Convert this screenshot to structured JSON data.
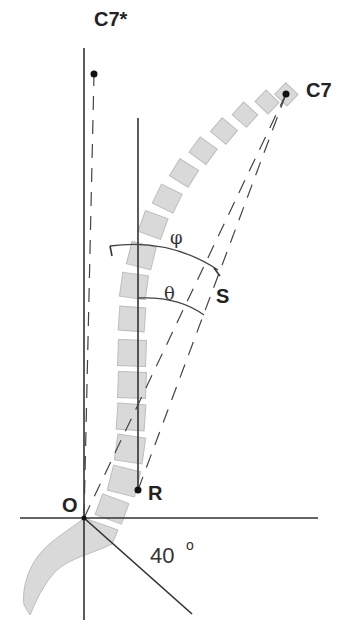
{
  "figure": {
    "labels": {
      "c7_star": "C7*",
      "c7": "C7",
      "phi": "φ",
      "theta": "θ",
      "s": "S",
      "origin": "O",
      "r": "R",
      "angle": "40",
      "degree": "o"
    },
    "colors": {
      "vertebra_fill": "#d9d9d9",
      "vertebra_stroke": "#bdbdbd",
      "line": "#333333",
      "text": "#222222"
    }
  }
}
